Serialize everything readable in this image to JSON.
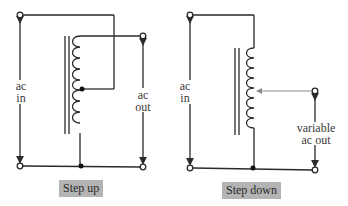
{
  "diagrams": [
    {
      "id": "step-up",
      "caption": "Step up",
      "input_label_line1": "ac",
      "input_label_line2": "in",
      "output_label_line1": "ac",
      "output_label_line2": "out"
    },
    {
      "id": "step-down",
      "caption": "Step down",
      "input_label_line1": "ac",
      "input_label_line2": "in",
      "output_label_line1": "variable",
      "output_label_line2": "ac out"
    }
  ],
  "colors": {
    "wire": "#2a2a2a",
    "caption_bg": "#b4b4b4",
    "tap_arrow": "#8a8a8a"
  }
}
